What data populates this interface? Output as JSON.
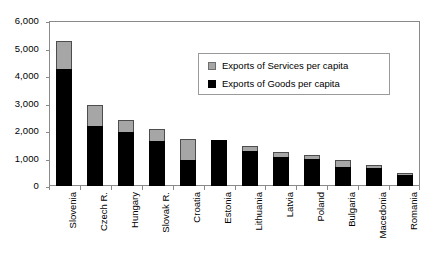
{
  "chart_data": {
    "type": "bar",
    "subtype": "stacked-vertical",
    "title": "",
    "subtitle": "",
    "xlabel": "",
    "ylabel": "",
    "ylim": [
      0,
      6000
    ],
    "ytick_step": 1000,
    "ytick_labels": [
      "6,000",
      "5,000",
      "4,000",
      "3,000",
      "2,000",
      "1,000",
      "0"
    ],
    "ytick_values": [
      6000,
      5000,
      4000,
      3000,
      2000,
      1000,
      0
    ],
    "grid": false,
    "legend_position": "inside-upper-right",
    "categories": [
      "Slovenia",
      "Czech R.",
      "Hungary",
      "Slovak R.",
      "Croatia",
      "Estonia",
      "Lithuania",
      "Latvia",
      "Poland",
      "Bulgaria",
      "Macedonia",
      "Romania"
    ],
    "series": [
      {
        "name": "Exports of Goods per capita",
        "color": "#000000",
        "values": [
          4270,
          2200,
          1950,
          1620,
          960,
          1660,
          1270,
          1060,
          980,
          700,
          640,
          390
        ]
      },
      {
        "name": "Exports of Services per capita",
        "color": "#a6a6a6",
        "values": [
          1000,
          740,
          440,
          450,
          750,
          0,
          200,
          170,
          150,
          260,
          110,
          100
        ]
      }
    ],
    "totals": [
      5270,
      2940,
      2390,
      2070,
      1710,
      1660,
      1470,
      1230,
      1130,
      960,
      750,
      490
    ]
  },
  "legend": {
    "items": [
      {
        "label": "Exports of Services per capita",
        "swatch": "services"
      },
      {
        "label": "Exports of Goods per capita",
        "swatch": "goods"
      }
    ]
  }
}
